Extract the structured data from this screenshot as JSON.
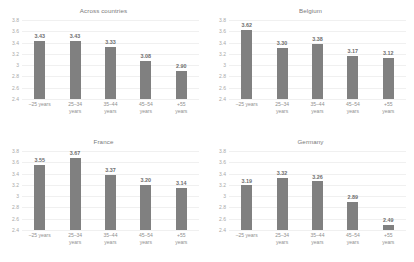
{
  "chart_data": {
    "type": "bar",
    "title": "",
    "xlabel": "",
    "ylabel": "",
    "ylim": [
      2.4,
      3.8
    ],
    "yticks": [
      "3.8",
      "3.6",
      "3.4",
      "3.2",
      "3",
      "2.8",
      "2.6",
      "2.4"
    ],
    "categories": [
      "–25 years",
      "25–34\nyears",
      "35–44\nyears",
      "45–54\nyears",
      "+55\nyears"
    ],
    "grid": true,
    "legend": "none",
    "bar_color": "#808080",
    "panels": [
      {
        "title": "Across countries",
        "values": [
          3.43,
          3.43,
          3.33,
          3.08,
          2.9
        ],
        "labels": [
          "3.43",
          "3.43",
          "3.33",
          "3.08",
          "2.90"
        ]
      },
      {
        "title": "Belgium",
        "values": [
          3.62,
          3.3,
          3.38,
          3.17,
          3.12
        ],
        "labels": [
          "3.62",
          "3.30",
          "3.38",
          "3.17",
          "3.12"
        ]
      },
      {
        "title": "France",
        "values": [
          3.55,
          3.67,
          3.37,
          3.2,
          3.14
        ],
        "labels": [
          "3.55",
          "3.67",
          "3.37",
          "3.20",
          "3.14"
        ]
      },
      {
        "title": "Germany",
        "values": [
          3.19,
          3.32,
          3.26,
          2.89,
          2.49
        ],
        "labels": [
          "3.19",
          "3.32",
          "3.26",
          "2.89",
          "2.49"
        ]
      }
    ]
  }
}
